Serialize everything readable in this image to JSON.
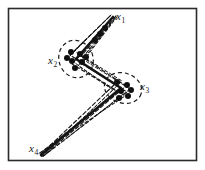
{
  "figure": {
    "background_color": "#ffffff",
    "ink_color": "#171717",
    "frame": {
      "name": "figure-border",
      "x": 8.5,
      "y": 8.5,
      "width": 188,
      "height": 152,
      "stroke_width": 1.6,
      "color": "#2b2b2b"
    },
    "labels": [
      {
        "id": "x1",
        "text": "x",
        "subscript": "1",
        "x": 116,
        "y": 11
      },
      {
        "id": "x2",
        "text": "x",
        "subscript": "2",
        "x": 48,
        "y": 55
      },
      {
        "id": "x3",
        "text": "x",
        "subscript": "3",
        "x": 140,
        "y": 81
      },
      {
        "id": "x4",
        "text": "x",
        "subscript": "4",
        "x": 29,
        "y": 143
      }
    ],
    "vertices": [
      {
        "id": "x1",
        "x": 113,
        "y": 17
      },
      {
        "id": "x2",
        "x": 76,
        "y": 59
      },
      {
        "id": "x3",
        "x": 121,
        "y": 88
      },
      {
        "id": "x4",
        "x": 41,
        "y": 155
      }
    ],
    "solid_path": {
      "name": "nominal-polyline",
      "points": "113,17 76,59 121,88 41,155",
      "stroke_width": 2.6,
      "color": "#141414"
    },
    "dashed_paths": [
      {
        "id": "variant-a",
        "points": "110,16 70,55 115,84 40,155",
        "dash": "4,2.5",
        "stroke_width": 1.15
      },
      {
        "id": "variant-b",
        "points": "116,16 81,56 126,86 43,156",
        "dash": "4,2.5",
        "stroke_width": 1.15
      },
      {
        "id": "variant-c",
        "points": "112,18 72,64 118,92 39,154",
        "dash": "3.5,2.5",
        "stroke_width": 1.1
      },
      {
        "id": "variant-d",
        "points": "115,18 79,62 127,92 42,157",
        "dash": "3.5,2.5",
        "stroke_width": 1.1
      },
      {
        "id": "variant-e",
        "points": "111,15 74,51 122,81 44,156",
        "dash": "3,2.5",
        "stroke_width": 1.0
      },
      {
        "id": "variant-f",
        "points": "114,20 78,66 125,96 38,154",
        "dash": "3,2.5",
        "stroke_width": 1.0
      },
      {
        "id": "variant-g",
        "points": "109,17 68,58 113,90 41,157",
        "dash": "3,2.2",
        "stroke_width": 0.95
      },
      {
        "id": "variant-h",
        "points": "117,17 84,60 130,89 45,155",
        "dash": "3,2.2",
        "stroke_width": 0.95
      }
    ],
    "ellipses": [
      {
        "id": "cluster-x2",
        "name": "uncertainty-ellipse-x2",
        "cx": 76,
        "cy": 59,
        "rx": 17,
        "ry": 19,
        "rotation": -22,
        "dash": "4,3",
        "stroke_width": 1.2
      },
      {
        "id": "cluster-x3",
        "name": "uncertainty-ellipse-x3",
        "cx": 123,
        "cy": 88,
        "rx": 19,
        "ry": 15,
        "rotation": 18,
        "dash": "4,3",
        "stroke_width": 1.2
      }
    ],
    "sample_points": {
      "name": "sample-dots",
      "radius": 3.0,
      "color": "#101010",
      "cluster_x2": [
        {
          "x": 71,
          "y": 52
        },
        {
          "x": 80,
          "y": 54
        },
        {
          "x": 72,
          "y": 61
        },
        {
          "x": 82,
          "y": 62
        },
        {
          "x": 75,
          "y": 68
        },
        {
          "x": 86,
          "y": 57
        },
        {
          "x": 67,
          "y": 58
        }
      ],
      "cluster_x3": [
        {
          "x": 117,
          "y": 82
        },
        {
          "x": 127,
          "y": 85
        },
        {
          "x": 121,
          "y": 91
        },
        {
          "x": 131,
          "y": 90
        },
        {
          "x": 119,
          "y": 98
        },
        {
          "x": 128,
          "y": 96
        }
      ],
      "along_top_segment": [
        {
          "x": 95,
          "y": 40
        },
        {
          "x": 100,
          "y": 34
        },
        {
          "x": 105,
          "y": 28
        }
      ]
    }
  }
}
